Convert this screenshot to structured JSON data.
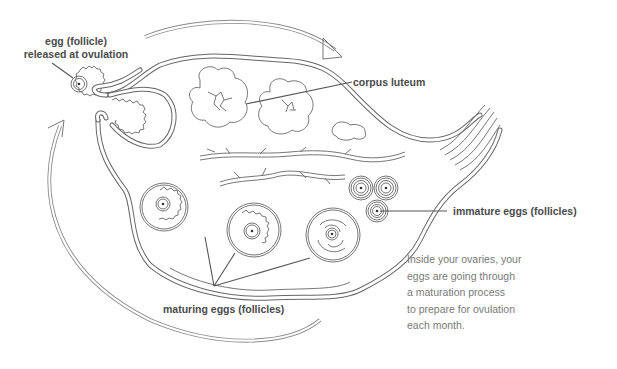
{
  "diagram": {
    "colors": {
      "line": "#666666",
      "label_text": "#4a4a4a",
      "caption_text": "#7a7a7a",
      "background": "#ffffff"
    },
    "labels": {
      "released_egg_line1": "egg (follicle)",
      "released_egg_line2": "released at ovulation",
      "corpus_luteum": "corpus luteum",
      "immature_eggs": "immature eggs (follicles)",
      "maturing_eggs": "maturing eggs (follicles)"
    },
    "caption": {
      "lines": [
        "Inside your ovaries, your",
        "eggs are going through",
        "a maturation process",
        "to prepare for ovulation",
        "each month."
      ]
    },
    "elements": {
      "cycle_arrows": [
        "top-arrow-clockwise",
        "left-arrow-upward"
      ],
      "immature_follicles_count": 3,
      "maturing_follicles_count": 3,
      "corpus_luteum_count": 2
    }
  }
}
